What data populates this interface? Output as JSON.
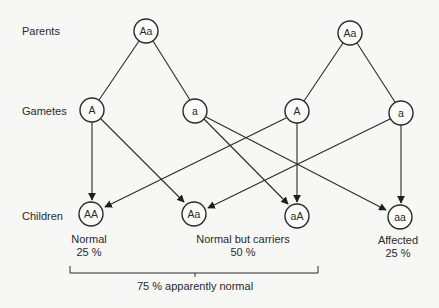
{
  "row_labels": {
    "parents": "Parents",
    "gametes": "Gametes",
    "children": "Children"
  },
  "parents": [
    {
      "id": "p1",
      "genotype": "Aa"
    },
    {
      "id": "p2",
      "genotype": "Aa"
    }
  ],
  "gametes": [
    {
      "id": "g1",
      "allele": "A",
      "parent": "p1"
    },
    {
      "id": "g2",
      "allele": "a",
      "parent": "p1"
    },
    {
      "id": "g3",
      "allele": "A",
      "parent": "p2"
    },
    {
      "id": "g4",
      "allele": "a",
      "parent": "p2"
    }
  ],
  "children": [
    {
      "id": "c1",
      "genotype": "AA",
      "from": [
        "g1",
        "g3"
      ]
    },
    {
      "id": "c2",
      "genotype": "Aa",
      "from": [
        "g1",
        "g4"
      ]
    },
    {
      "id": "c3",
      "genotype": "aA",
      "from": [
        "g2",
        "g3"
      ]
    },
    {
      "id": "c4",
      "genotype": "aa",
      "from": [
        "g2",
        "g4"
      ]
    }
  ],
  "outcomes": {
    "normal": {
      "label": "Normal",
      "percent": "25 %"
    },
    "carriers": {
      "label": "Normal but carriers",
      "percent": "50 %"
    },
    "affected": {
      "label": "Affected",
      "percent": "25 %"
    }
  },
  "bracket_label": "75 % apparently normal",
  "colors": {
    "background": "#f7f7f5",
    "stroke": "#2a2a2a"
  }
}
